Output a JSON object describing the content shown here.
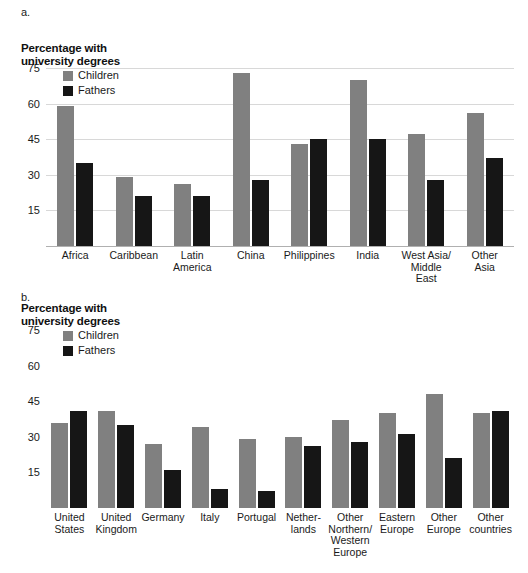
{
  "figure": {
    "panels": [
      {
        "letter": "a.",
        "axis_title_line1": "Percentage with",
        "axis_title_line2": "university degrees"
      },
      {
        "letter": "b.",
        "axis_title_line1": "Percentage with",
        "axis_title_line2": "university degrees"
      }
    ],
    "legend": {
      "children_label": "Children",
      "fathers_label": "Fathers",
      "children_color": "#808080",
      "fathers_color": "#161616"
    }
  },
  "chart_data": [
    {
      "type": "bar",
      "title": "Percentage with university degrees",
      "panel": "a.",
      "xlabel": "",
      "ylabel": "Percentage with university degrees",
      "ylim": [
        0,
        75
      ],
      "yticks": [
        75,
        60,
        45,
        30,
        15
      ],
      "grid": true,
      "legend_position": "top-left",
      "categories": [
        "Africa",
        "Caribbean",
        "Latin America",
        "China",
        "Philippines",
        "India",
        "West Asia/ Middle East",
        "Other Asia"
      ],
      "category_lines": [
        [
          "Africa"
        ],
        [
          "Caribbean"
        ],
        [
          "Latin",
          "America"
        ],
        [
          "China"
        ],
        [
          "Philippines"
        ],
        [
          "India"
        ],
        [
          "West Asia/",
          "Middle",
          "East"
        ],
        [
          "Other",
          "Asia"
        ]
      ],
      "series": [
        {
          "name": "Children",
          "color": "#808080",
          "values": [
            59,
            29,
            26,
            73,
            43,
            70,
            47,
            56
          ]
        },
        {
          "name": "Fathers",
          "color": "#161616",
          "values": [
            35,
            21,
            21,
            28,
            45,
            45,
            28,
            37
          ]
        }
      ]
    },
    {
      "type": "bar",
      "title": "Percentage with university degrees",
      "panel": "b.",
      "xlabel": "",
      "ylabel": "Percentage with university degrees",
      "ylim": [
        0,
        75
      ],
      "yticks": [
        75,
        60,
        45,
        30,
        15
      ],
      "grid": true,
      "legend_position": "top-left",
      "categories": [
        "United States",
        "United Kingdom",
        "Germany",
        "Italy",
        "Portugal",
        "Netherlands",
        "Other Northern/ Western Europe",
        "Eastern Europe",
        "Other Europe",
        "Other countries"
      ],
      "category_lines": [
        [
          "United",
          "States"
        ],
        [
          "United",
          "Kingdom"
        ],
        [
          "Germany"
        ],
        [
          "Italy"
        ],
        [
          "Portugal"
        ],
        [
          "Nether-",
          "lands"
        ],
        [
          "Other",
          "Northern/",
          "Western",
          "Europe"
        ],
        [
          "Eastern",
          "Europe"
        ],
        [
          "Other",
          "Europe"
        ],
        [
          "Other",
          "countries"
        ]
      ],
      "series": [
        {
          "name": "Children",
          "color": "#808080",
          "values": [
            36,
            41,
            27,
            34,
            29,
            30,
            37,
            40,
            48,
            40
          ]
        },
        {
          "name": "Fathers",
          "color": "#161616",
          "values": [
            41,
            35,
            16,
            8,
            7,
            26,
            28,
            31,
            21,
            41
          ]
        }
      ]
    }
  ]
}
